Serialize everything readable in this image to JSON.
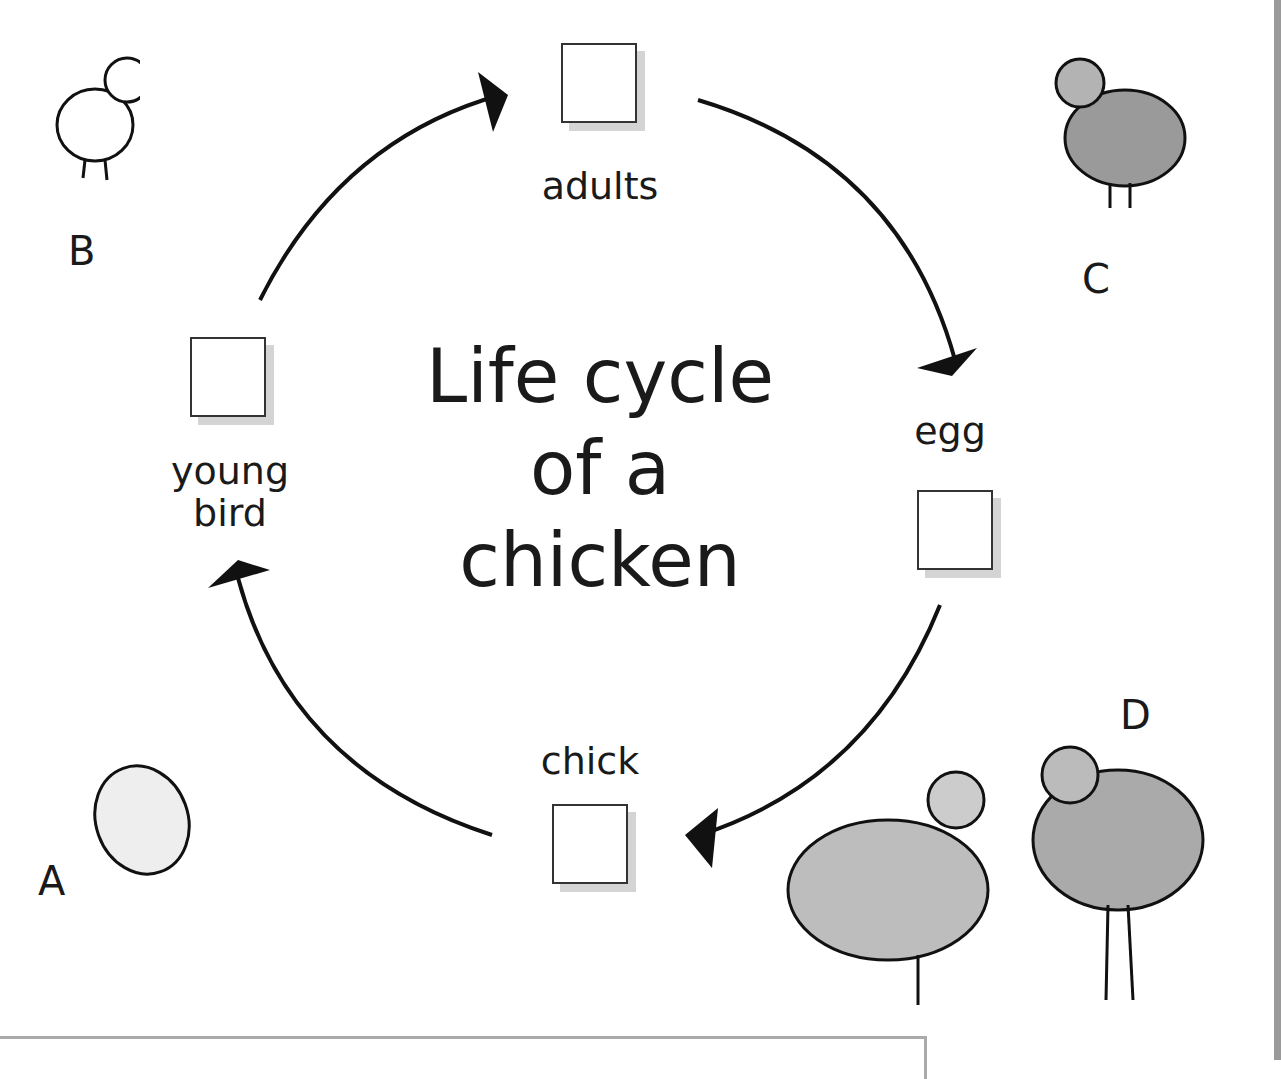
{
  "title": "Life cycle of a chicken",
  "title_lines": [
    "Life cycle",
    "of a",
    "chicken"
  ],
  "stages": [
    {
      "label": "adults"
    },
    {
      "label": "egg"
    },
    {
      "label": "chick"
    },
    {
      "label_lines": [
        "young",
        "bird"
      ]
    }
  ],
  "picture_letters": [
    "A",
    "B",
    "C",
    "D"
  ],
  "pictures": {
    "A": "egg",
    "B": "young bird",
    "C": "hen",
    "D": "hen and rooster"
  }
}
